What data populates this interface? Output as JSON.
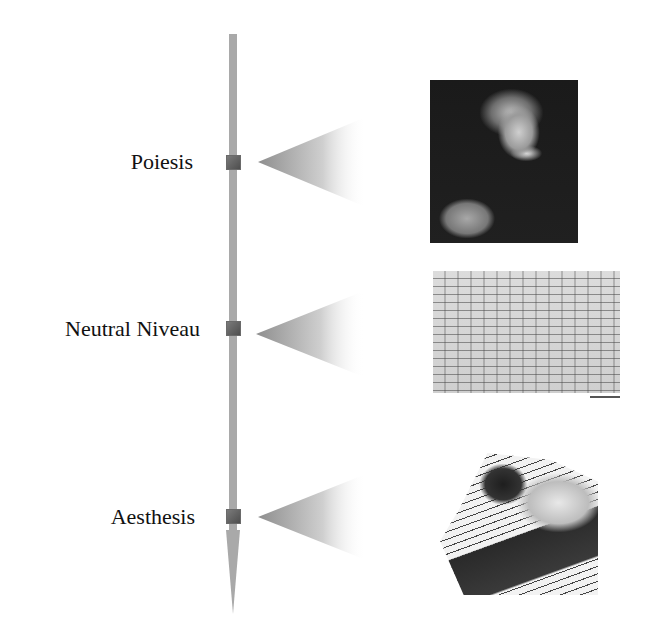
{
  "diagram": {
    "levels": [
      {
        "label": "Poiesis",
        "image": "composer-portrait"
      },
      {
        "label": "Neutral Niveau",
        "image": "musical-manuscript"
      },
      {
        "label": "Aesthesis",
        "image": "listener-at-piano"
      }
    ]
  },
  "colors": {
    "axis": "#a9a9a9",
    "marker": "#5a5a5a",
    "cone": "#9a9a9a"
  }
}
